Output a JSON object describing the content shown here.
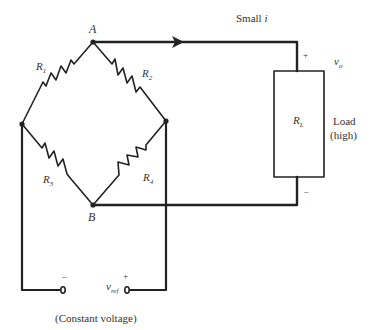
{
  "diagram": {
    "type": "wheatstone-bridge-circuit",
    "nodes": {
      "top": "A",
      "bottom": "B"
    },
    "current_label": {
      "prefix": "Small ",
      "symbol": "i"
    },
    "resistors": [
      {
        "id": "R1",
        "base": "R",
        "sub": "1"
      },
      {
        "id": "R2",
        "base": "R",
        "sub": "2"
      },
      {
        "id": "R3",
        "base": "R",
        "sub": "3"
      },
      {
        "id": "R4",
        "base": "R",
        "sub": "4"
      }
    ],
    "load": {
      "resistor": {
        "base": "R",
        "sub": "L"
      },
      "label_line1": "Load",
      "label_line2": "(high)",
      "output_voltage": {
        "base": "v",
        "sub": "o"
      },
      "plus": "+",
      "minus": "–"
    },
    "source": {
      "voltage": {
        "base": "v",
        "sub": "ref"
      },
      "plus": "+",
      "minus": "–",
      "caption": "(Constant voltage)"
    }
  }
}
